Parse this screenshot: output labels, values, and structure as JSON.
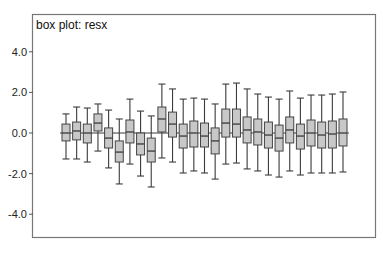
{
  "chart_data": {
    "type": "box",
    "title": "box plot: resx",
    "xlabel": "",
    "ylabel": "",
    "ylim": [
      -5.2,
      5.8
    ],
    "yticks": [
      4.0,
      2.0,
      0.0,
      -2.0,
      -4.0
    ],
    "ytick_labels": [
      "4.0",
      "2.0",
      "0.0",
      "-2.0",
      "-4.0"
    ],
    "grid": false,
    "legend": null,
    "reference_line": 0.0,
    "colors": {
      "box_fill": "#c8c8c8",
      "box_stroke": "#444444",
      "frame": "#777777"
    },
    "series": [
      {
        "index": 1,
        "whisker_high": 0.94,
        "q3": 0.44,
        "median": 0.0,
        "q1": -0.39,
        "whisker_low": -1.28
      },
      {
        "index": 2,
        "whisker_high": 1.28,
        "q3": 0.54,
        "median": 0.1,
        "q1": -0.34,
        "whisker_low": -1.28
      },
      {
        "index": 3,
        "whisker_high": 1.23,
        "q3": 0.44,
        "median": 0.0,
        "q1": -0.49,
        "whisker_low": -1.43
      },
      {
        "index": 4,
        "whisker_high": 1.43,
        "q3": 0.94,
        "median": 0.49,
        "q1": 0.1,
        "whisker_low": -0.89
      },
      {
        "index": 5,
        "whisker_high": 1.13,
        "q3": 0.25,
        "median": -0.25,
        "q1": -0.74,
        "whisker_low": -1.72
      },
      {
        "index": 6,
        "whisker_high": 0.69,
        "q3": -0.39,
        "median": -0.94,
        "q1": -1.43,
        "whisker_low": -2.51
      },
      {
        "index": 7,
        "whisker_high": 1.67,
        "q3": 0.64,
        "median": 0.05,
        "q1": -0.49,
        "whisker_low": -1.53
      },
      {
        "index": 8,
        "whisker_high": 1.08,
        "q3": 0.0,
        "median": -0.54,
        "q1": -1.08,
        "whisker_low": -2.12
      },
      {
        "index": 9,
        "whisker_high": 0.84,
        "q3": -0.25,
        "median": -0.89,
        "q1": -1.43,
        "whisker_low": -2.66
      },
      {
        "index": 10,
        "whisker_high": 2.41,
        "q3": 1.28,
        "median": 0.69,
        "q1": 0.05,
        "whisker_low": -1.23
      },
      {
        "index": 11,
        "whisker_high": 2.17,
        "q3": 1.03,
        "median": 0.44,
        "q1": -0.2,
        "whisker_low": -1.43
      },
      {
        "index": 12,
        "whisker_high": 1.67,
        "q3": 0.44,
        "median": -0.15,
        "q1": -0.74,
        "whisker_low": -1.97
      },
      {
        "index": 13,
        "whisker_high": 1.72,
        "q3": 0.59,
        "median": 0.0,
        "q1": -0.69,
        "whisker_low": -1.87
      },
      {
        "index": 14,
        "whisker_high": 1.67,
        "q3": 0.49,
        "median": -0.15,
        "q1": -0.69,
        "whisker_low": -1.97
      },
      {
        "index": 15,
        "whisker_high": 1.43,
        "q3": 0.25,
        "median": -0.39,
        "q1": -1.03,
        "whisker_low": -2.27
      },
      {
        "index": 16,
        "whisker_high": 2.41,
        "q3": 1.18,
        "median": 0.49,
        "q1": -0.2,
        "whisker_low": -1.53
      },
      {
        "index": 17,
        "whisker_high": 2.46,
        "q3": 1.18,
        "median": 0.44,
        "q1": -0.2,
        "whisker_low": -1.48
      },
      {
        "index": 18,
        "whisker_high": 2.17,
        "q3": 0.79,
        "median": 0.15,
        "q1": -0.49,
        "whisker_low": -1.77
      },
      {
        "index": 19,
        "whisker_high": 1.92,
        "q3": 0.69,
        "median": 0.05,
        "q1": -0.59,
        "whisker_low": -1.87
      },
      {
        "index": 20,
        "whisker_high": 1.77,
        "q3": 0.54,
        "median": -0.1,
        "q1": -0.74,
        "whisker_low": -2.07
      },
      {
        "index": 21,
        "whisker_high": 1.67,
        "q3": 0.39,
        "median": -0.25,
        "q1": -0.89,
        "whisker_low": -2.17
      },
      {
        "index": 22,
        "whisker_high": 2.07,
        "q3": 0.79,
        "median": 0.15,
        "q1": -0.49,
        "whisker_low": -1.87
      },
      {
        "index": 23,
        "whisker_high": 1.72,
        "q3": 0.44,
        "median": -0.15,
        "q1": -0.79,
        "whisker_low": -2.07
      },
      {
        "index": 24,
        "whisker_high": 1.87,
        "q3": 0.64,
        "median": 0.0,
        "q1": -0.64,
        "whisker_low": -1.97
      },
      {
        "index": 25,
        "whisker_high": 1.87,
        "q3": 0.54,
        "median": -0.1,
        "q1": -0.74,
        "whisker_low": -1.97
      },
      {
        "index": 26,
        "whisker_high": 1.92,
        "q3": 0.59,
        "median": -0.05,
        "q1": -0.74,
        "whisker_low": -1.97
      },
      {
        "index": 27,
        "whisker_high": 2.02,
        "q3": 0.69,
        "median": 0.0,
        "q1": -0.64,
        "whisker_low": -1.92
      }
    ]
  }
}
